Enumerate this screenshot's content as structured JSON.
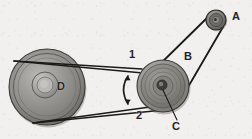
{
  "figure": {
    "background_color": "#f1f0ee",
    "line_color": "#1c1c1c",
    "pulley_fill": "#8d8d8a",
    "labels": {
      "A": "A",
      "B": "B",
      "C": "C",
      "D": "D",
      "belt_1": "1",
      "belt_2": "2"
    },
    "parts": [
      {
        "id": "A",
        "name": "small-pulley-a",
        "label": "A",
        "cx": 216,
        "cy": 20,
        "r": 10
      },
      {
        "id": "C",
        "name": "stepped-pulley-c",
        "label": "C",
        "cx": 163,
        "cy": 86,
        "r": 26
      },
      {
        "id": "D",
        "name": "large-pulley-d",
        "label": "D",
        "cx": 47,
        "cy": 87,
        "r": 38
      }
    ],
    "belts": [
      {
        "id": "1",
        "name": "belt-1",
        "label": "1",
        "from": "D",
        "to": "C",
        "side": "top"
      },
      {
        "id": "2",
        "name": "belt-2",
        "label": "2",
        "from": "D",
        "to": "C",
        "side": "bottom"
      },
      {
        "id": "B",
        "name": "belt-b",
        "label": "B",
        "from": "C",
        "to": "A",
        "side": "right"
      }
    ],
    "arrow": {
      "name": "rotation-arrow",
      "type": "double-headed-curved",
      "cx": 127,
      "top_y": 73,
      "bottom_y": 107
    }
  }
}
